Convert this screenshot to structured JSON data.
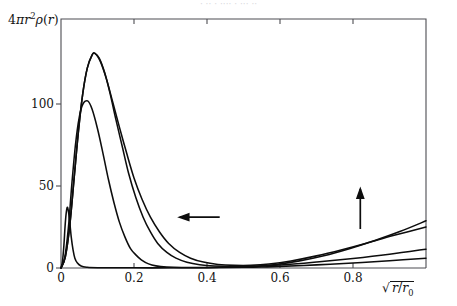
{
  "figure": {
    "caption_cutoff": "· ·· ·  ····          ·        ···   ··",
    "background_color": "#ffffff",
    "frame_color": "#4d4d52",
    "curve_color": "#0d0d0d"
  },
  "labels": {
    "y_axis": "4πr²ρ(r)",
    "y_axis_parts": {
      "coefficient": "4",
      "pi": "π",
      "r": "r",
      "exponent": "2",
      "rho": "ρ",
      "open": "(",
      "arg": "r",
      "close": ")"
    },
    "x_axis": "√(r/r₀)",
    "x_axis_parts": {
      "radical": "√",
      "numerator": "r",
      "slash": "/",
      "denominator": "r",
      "subscript": "0"
    }
  },
  "annotations": [
    {
      "name": "left-arrow",
      "direction": "left",
      "meaning": "peak-shifts-left",
      "x_data": 0.38,
      "y_data": 31
    },
    {
      "name": "up-arrow",
      "direction": "up",
      "meaning": "tail-rises",
      "x_data": 0.82,
      "y_data": 36
    }
  ],
  "chart_data": {
    "type": "line",
    "title": "",
    "subtitle": "",
    "xlabel": "√(r/r₀)",
    "ylabel": "4πr²ρ(r)",
    "xlim": [
      0,
      1.0
    ],
    "ylim": [
      0,
      152
    ],
    "grid": false,
    "legend": null,
    "legend_position": "none",
    "x_ticks": [
      0,
      0.2,
      0.4,
      0.6,
      0.8
    ],
    "x_tick_labels": [
      "0",
      "0.2",
      "0.4",
      "0.6",
      "0.8"
    ],
    "y_ticks": [
      0,
      50,
      100
    ],
    "y_tick_labels": [
      "0",
      "50",
      "100"
    ],
    "minor_frame_ticks_top": [
      0.2,
      0.4,
      0.6,
      0.8
    ],
    "series": [
      {
        "name": "curve-1-narrow",
        "description": "narrowest, lowest peak near origin; negligible tail",
        "points": [
          [
            0.0,
            0
          ],
          [
            0.004,
            4
          ],
          [
            0.008,
            14
          ],
          [
            0.011,
            25
          ],
          [
            0.014,
            33
          ],
          [
            0.017,
            37
          ],
          [
            0.02,
            35
          ],
          [
            0.024,
            28
          ],
          [
            0.028,
            19
          ],
          [
            0.033,
            11
          ],
          [
            0.038,
            6
          ],
          [
            0.045,
            3
          ],
          [
            0.055,
            1.2
          ],
          [
            0.07,
            0.5
          ],
          [
            0.1,
            0.2
          ],
          [
            0.2,
            0.1
          ],
          [
            0.3,
            0.1
          ],
          [
            0.4,
            0.2
          ],
          [
            0.5,
            0.4
          ],
          [
            0.55,
            0.6
          ],
          [
            0.6,
            1.0
          ],
          [
            0.7,
            1.9
          ],
          [
            0.8,
            3.0
          ],
          [
            0.9,
            4.4
          ],
          [
            1.0,
            6.0
          ]
        ]
      },
      {
        "name": "curve-2-mid",
        "description": "medium-width peak ~102 at x~0.073, fast decay",
        "points": [
          [
            0.0,
            0
          ],
          [
            0.01,
            6
          ],
          [
            0.02,
            24
          ],
          [
            0.03,
            52
          ],
          [
            0.04,
            76
          ],
          [
            0.05,
            92
          ],
          [
            0.06,
            100
          ],
          [
            0.073,
            102
          ],
          [
            0.085,
            97
          ],
          [
            0.1,
            85
          ],
          [
            0.115,
            70
          ],
          [
            0.13,
            54
          ],
          [
            0.145,
            40
          ],
          [
            0.16,
            28
          ],
          [
            0.175,
            19
          ],
          [
            0.19,
            12
          ],
          [
            0.205,
            8
          ],
          [
            0.22,
            5
          ],
          [
            0.24,
            2.5
          ],
          [
            0.26,
            1.3
          ],
          [
            0.29,
            0.6
          ],
          [
            0.33,
            0.3
          ],
          [
            0.4,
            0.3
          ],
          [
            0.48,
            0.6
          ],
          [
            0.53,
            0.9
          ],
          [
            0.6,
            1.8
          ],
          [
            0.7,
            3.6
          ],
          [
            0.8,
            5.8
          ],
          [
            0.9,
            8.4
          ],
          [
            1.0,
            11.5
          ]
        ]
      },
      {
        "name": "curve-3-tall",
        "description": "tallest peak ~131 at x~0.093; broad right shoulder; strong rising tail",
        "points": [
          [
            0.0,
            0
          ],
          [
            0.012,
            7
          ],
          [
            0.024,
            26
          ],
          [
            0.036,
            55
          ],
          [
            0.048,
            84
          ],
          [
            0.06,
            107
          ],
          [
            0.072,
            122
          ],
          [
            0.085,
            130
          ],
          [
            0.093,
            131
          ],
          [
            0.105,
            128
          ],
          [
            0.12,
            119
          ],
          [
            0.135,
            106
          ],
          [
            0.15,
            91
          ],
          [
            0.168,
            74
          ],
          [
            0.185,
            58
          ],
          [
            0.205,
            43
          ],
          [
            0.225,
            31
          ],
          [
            0.245,
            22
          ],
          [
            0.265,
            15
          ],
          [
            0.29,
            9.5
          ],
          [
            0.315,
            6
          ],
          [
            0.345,
            3.5
          ],
          [
            0.38,
            2.0
          ],
          [
            0.42,
            1.2
          ],
          [
            0.47,
            0.9
          ],
          [
            0.53,
            1.1
          ],
          [
            0.59,
            2.2
          ],
          [
            0.65,
            4.2
          ],
          [
            0.72,
            7.5
          ],
          [
            0.79,
            11.8
          ],
          [
            0.86,
            16.8
          ],
          [
            0.93,
            22.4
          ],
          [
            1.0,
            28.8
          ]
        ]
      },
      {
        "name": "curve-4-broadtail",
        "description": "overlays tall peak, broader decay tail, intermediate rising tail",
        "points": [
          [
            0.0,
            0
          ],
          [
            0.012,
            7
          ],
          [
            0.024,
            26
          ],
          [
            0.036,
            55
          ],
          [
            0.048,
            84
          ],
          [
            0.06,
            107
          ],
          [
            0.072,
            122
          ],
          [
            0.085,
            130
          ],
          [
            0.093,
            131
          ],
          [
            0.108,
            126
          ],
          [
            0.125,
            115
          ],
          [
            0.142,
            101
          ],
          [
            0.16,
            86
          ],
          [
            0.18,
            70
          ],
          [
            0.2,
            55
          ],
          [
            0.222,
            42
          ],
          [
            0.245,
            31
          ],
          [
            0.27,
            22
          ],
          [
            0.295,
            15
          ],
          [
            0.325,
            9.5
          ],
          [
            0.355,
            6
          ],
          [
            0.39,
            3.6
          ],
          [
            0.43,
            2.2
          ],
          [
            0.475,
            1.6
          ],
          [
            0.52,
            1.6
          ],
          [
            0.57,
            2.4
          ],
          [
            0.63,
            4.3
          ],
          [
            0.7,
            7.4
          ],
          [
            0.77,
            11.2
          ],
          [
            0.84,
            15.4
          ],
          [
            0.91,
            19.8
          ],
          [
            1.0,
            25.0
          ]
        ]
      }
    ]
  },
  "geometry": {
    "plot_left_px": 61,
    "plot_right_px": 426,
    "plot_top_px": 19,
    "plot_bottom_px": 268,
    "x_px_per_unit": 365,
    "y_px_per_50": 82
  }
}
